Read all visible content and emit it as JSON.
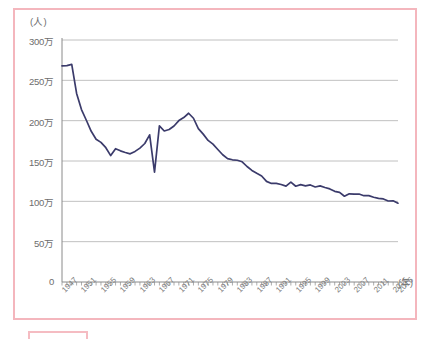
{
  "chart_data": {
    "type": "line",
    "title": "",
    "xlabel": "年",
    "ylabel": "人",
    "y_unit_label": "(人)",
    "x_unit_label": "(年)",
    "xlim": [
      1947,
      2016
    ],
    "ylim": [
      0,
      3000000
    ],
    "grid": true,
    "legend": "none",
    "y_ticks": [
      0,
      500000,
      1000000,
      1500000,
      2000000,
      2500000,
      3000000
    ],
    "y_tick_labels": [
      "0",
      "50万",
      "100万",
      "150万",
      "200万",
      "250万",
      "300万"
    ],
    "x_tick_labels": [
      "1947",
      "1951",
      "1955",
      "1959",
      "1963",
      "1967",
      "1971",
      "1975",
      "1979",
      "1983",
      "1987",
      "1991",
      "1995",
      "1999",
      "2003",
      "2007",
      "2011",
      "2015",
      "2016"
    ],
    "series": [
      {
        "name": "出生数",
        "color": "#3b3b6b",
        "x": [
          1947,
          1948,
          1949,
          1950,
          1951,
          1952,
          1953,
          1954,
          1955,
          1956,
          1957,
          1958,
          1959,
          1960,
          1961,
          1962,
          1963,
          1964,
          1965,
          1966,
          1967,
          1968,
          1969,
          1970,
          1971,
          1972,
          1973,
          1974,
          1975,
          1976,
          1977,
          1978,
          1979,
          1980,
          1981,
          1982,
          1983,
          1984,
          1985,
          1986,
          1987,
          1988,
          1989,
          1990,
          1991,
          1992,
          1993,
          1994,
          1995,
          1996,
          1997,
          1998,
          1999,
          2000,
          2001,
          2002,
          2003,
          2004,
          2005,
          2006,
          2007,
          2008,
          2009,
          2010,
          2011,
          2012,
          2013,
          2014,
          2015,
          2016
        ],
        "values": [
          2679000,
          2682000,
          2697000,
          2338000,
          2138000,
          2005000,
          1868000,
          1770000,
          1731000,
          1665000,
          1567000,
          1653000,
          1626000,
          1606000,
          1589000,
          1619000,
          1660000,
          1717000,
          1824000,
          1361000,
          1936000,
          1872000,
          1890000,
          1934000,
          2001000,
          2039000,
          2092000,
          2030000,
          1901000,
          1833000,
          1755000,
          1709000,
          1643000,
          1577000,
          1529000,
          1515000,
          1509000,
          1490000,
          1432000,
          1383000,
          1347000,
          1314000,
          1247000,
          1222000,
          1223000,
          1209000,
          1188000,
          1238000,
          1187000,
          1207000,
          1192000,
          1203000,
          1178000,
          1191000,
          1171000,
          1154000,
          1124000,
          1111000,
          1063000,
          1093000,
          1090000,
          1091000,
          1070000,
          1071000,
          1051000,
          1037000,
          1030000,
          1004000,
          1006000,
          977000
        ]
      }
    ],
    "annotations": [
      {
        "label": "第1次ベビーブーム",
        "year": 1949,
        "value": 2697000
      },
      {
        "label": "ひのえうま",
        "year": 1966,
        "value": 1361000
      },
      {
        "label": "第2次ベビーブーム",
        "year": 1973,
        "value": 2092000
      }
    ]
  },
  "colors": {
    "frame": "#f4b6bd",
    "line": "#3b3b6b",
    "grid": "#b0b0b0",
    "axis": "#8a8a8a",
    "label": "#6d6d6d"
  }
}
